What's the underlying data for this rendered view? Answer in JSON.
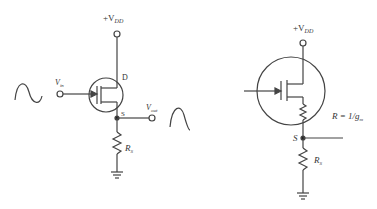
{
  "diagram": {
    "left_circuit": {
      "supply_label": "+V",
      "supply_sub": "DD",
      "drain_label": "D",
      "source_label": "S",
      "input_label": "V",
      "input_sub": "in",
      "output_label": "V",
      "output_sub": "out",
      "source_resistor_label": "R",
      "source_resistor_sub": "S"
    },
    "right_circuit": {
      "supply_label": "+V",
      "supply_sub": "DD",
      "internal_resistor_label": "R = 1/g",
      "internal_resistor_sub": "m",
      "source_node_label": "S",
      "source_resistor_label": "R",
      "source_resistor_sub": "S"
    },
    "colors": {
      "stroke": "#444444",
      "text": "#333333"
    }
  }
}
